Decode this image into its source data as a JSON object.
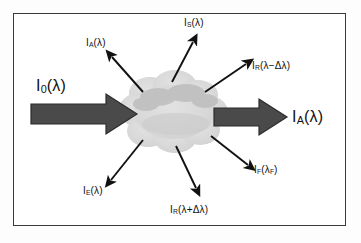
{
  "figure": {
    "frame_color": "#3a3a3a",
    "background_color": "#ffffff",
    "cloud_color": "#d8d8d8",
    "cloud_shadow_color": "#b6b6b6",
    "arrow_color": "#4a4a4a",
    "thin_arrow_color": "#111111"
  },
  "beams": {
    "incident": {
      "name": "incident-beam",
      "symbol": "I",
      "subscript": "0",
      "argument": "(λ)",
      "label": "I0(λ)"
    },
    "transmitted": {
      "name": "transmitted-beam",
      "symbol": "I",
      "subscript": "A",
      "argument": "(λ)",
      "label": "IA(λ)"
    }
  },
  "scattered": [
    {
      "id": "absorbed-up-left",
      "symbol": "I",
      "subscript": "A",
      "argument": "(λ)",
      "label": "IA(λ)"
    },
    {
      "id": "scattered-up",
      "symbol": "I",
      "subscript": "S",
      "argument": "(λ)",
      "label": "IS(λ)"
    },
    {
      "id": "raman-anti-stokes",
      "symbol": "I",
      "subscript": "R",
      "argument": "(λ−Δλ)",
      "label": "IR(λ−Δλ)"
    },
    {
      "id": "fluorescence",
      "symbol": "I",
      "subscript": "F",
      "argument": "(λF)",
      "label": "IF(λF)"
    },
    {
      "id": "raman-stokes",
      "symbol": "I",
      "subscript": "R",
      "argument": "(λ+Δλ)",
      "label": "IR(λ+Δλ)"
    },
    {
      "id": "emitted-down-left",
      "symbol": "I",
      "subscript": "E",
      "argument": "(λ)",
      "label": "IE(λ)"
    }
  ]
}
